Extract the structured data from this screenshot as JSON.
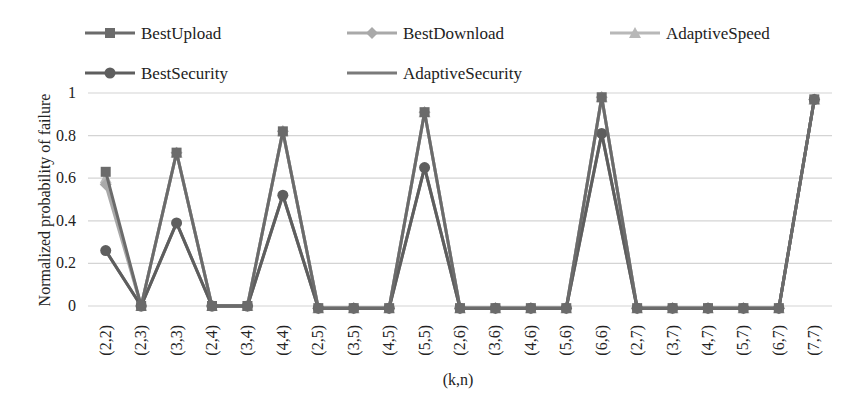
{
  "chart_data": {
    "type": "line",
    "title": "",
    "xlabel": "(k,n)",
    "ylabel": "Normalized probability of failure",
    "ylim": [
      0,
      1
    ],
    "yticks": [
      "0",
      "0.2",
      "0.4",
      "0.6",
      "0.8",
      "1"
    ],
    "grid": true,
    "legend_position": "top",
    "categories": [
      "(2,2)",
      "(2,3)",
      "(3,3)",
      "(2,4)",
      "(3,4)",
      "(4,4)",
      "(2,5)",
      "(3,5)",
      "(4,5)",
      "(5,5)",
      "(2,6)",
      "(3,6)",
      "(4,6)",
      "(5,6)",
      "(6,6)",
      "(2,7)",
      "(3,7)",
      "(4,7)",
      "(5,7)",
      "(6,7)",
      "(7,7)"
    ],
    "series": [
      {
        "name": "BestUpload",
        "marker": "square",
        "color": "#6b6b6b",
        "values": [
          0.63,
          0.0,
          0.72,
          0.0,
          0.0,
          0.82,
          -0.01,
          -0.01,
          -0.01,
          0.91,
          -0.01,
          -0.01,
          -0.01,
          -0.01,
          0.98,
          -0.01,
          -0.01,
          -0.01,
          -0.01,
          -0.01,
          0.97
        ]
      },
      {
        "name": "BestDownload",
        "marker": "diamond",
        "color": "#a9a9a9",
        "values": [
          0.57,
          0.0,
          0.72,
          0.0,
          0.0,
          0.82,
          -0.01,
          -0.01,
          -0.01,
          0.91,
          -0.01,
          -0.01,
          -0.01,
          -0.01,
          0.98,
          -0.01,
          -0.01,
          -0.01,
          -0.01,
          -0.01,
          0.97
        ]
      },
      {
        "name": "AdaptiveSpeed",
        "marker": "triangle",
        "color": "#b8b8b8",
        "values": [
          0.6,
          0.0,
          0.72,
          0.0,
          0.0,
          0.82,
          -0.01,
          -0.01,
          -0.01,
          0.91,
          -0.01,
          -0.01,
          -0.01,
          -0.01,
          0.98,
          -0.01,
          -0.01,
          -0.01,
          -0.01,
          -0.01,
          0.97
        ]
      },
      {
        "name": "BestSecurity",
        "marker": "circle",
        "color": "#5e5e5e",
        "values": [
          0.26,
          0.0,
          0.39,
          0.0,
          0.0,
          0.52,
          -0.01,
          -0.01,
          -0.01,
          0.65,
          -0.01,
          -0.01,
          -0.01,
          -0.01,
          0.81,
          -0.01,
          -0.01,
          -0.01,
          -0.01,
          -0.01,
          0.97
        ]
      },
      {
        "name": "AdaptiveSecurity",
        "marker": "none",
        "color": "#7a7a7a",
        "values": [
          0.26,
          0.0,
          0.39,
          0.0,
          0.0,
          0.52,
          -0.01,
          -0.01,
          -0.01,
          0.65,
          -0.01,
          -0.01,
          -0.01,
          -0.01,
          0.81,
          -0.01,
          -0.01,
          -0.01,
          -0.01,
          -0.01,
          0.97
        ]
      }
    ]
  }
}
